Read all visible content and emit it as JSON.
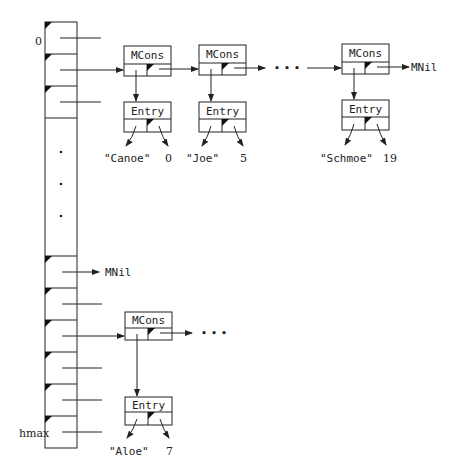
{
  "diagram": {
    "array": {
      "first_index_label": "0",
      "last_index_label": "hmax",
      "ellipsis_dots": 3
    },
    "chain_top": {
      "nodes": [
        {
          "type": "MCons",
          "entry": {
            "type": "Entry",
            "key": "\"Canoe\"",
            "value": "0"
          }
        },
        {
          "type": "MCons",
          "entry": {
            "type": "Entry",
            "key": "\"Joe\"",
            "value": "5"
          }
        },
        {
          "type": "MCons",
          "entry": {
            "type": "Entry",
            "key": "\"Schmoe\"",
            "value": "19"
          }
        }
      ],
      "ellipsis": "• • •",
      "terminator": "MNil"
    },
    "nil_row": {
      "terminator": "MNil"
    },
    "chain_bottom": {
      "nodes": [
        {
          "type": "MCons",
          "entry": {
            "type": "Entry",
            "key": "\"Aloe\"",
            "value": "7"
          }
        }
      ],
      "ellipsis": "• • •"
    }
  }
}
